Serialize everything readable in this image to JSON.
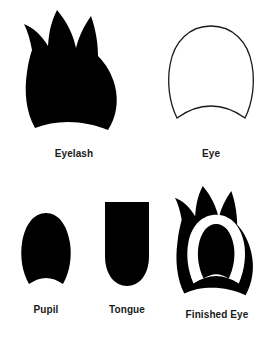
{
  "sheet": {
    "background_color": "#ffffff",
    "ink_color": "#000000",
    "label_color": "#1a1a1a",
    "width": 273,
    "height": 338
  },
  "parts": [
    {
      "id": "eyelash",
      "label": "Eyelash",
      "shape": "flame-silhouette",
      "fill": "#000000",
      "stroke": "none",
      "description": "Solid black flame-like eyelash with three pointed spikes along the top and a concave bottom edge"
    },
    {
      "id": "eye",
      "label": "Eye",
      "shape": "dome-outline",
      "fill": "#ffffff",
      "stroke": "#1a1a1a",
      "description": "White dome / egg shape with thin black outline, rounded top and concave bottom edge"
    },
    {
      "id": "pupil",
      "label": "Pupil",
      "shape": "oval",
      "fill": "#000000",
      "stroke": "none",
      "description": "Small solid black oval with a slightly concave bottom edge"
    },
    {
      "id": "tongue",
      "label": "Tongue",
      "shape": "flat-top-round-bottom",
      "fill": "#000000",
      "stroke": "none",
      "description": "Solid black shape with a flat top and a rounded bottom"
    },
    {
      "id": "finished-eye",
      "label": "Finished Eye",
      "shape": "assembled-composite",
      "fill": "#000000",
      "stroke": "none",
      "description": "Completed assembly: black flame eyelash behind a white eye with a black pupil centered inside"
    }
  ]
}
